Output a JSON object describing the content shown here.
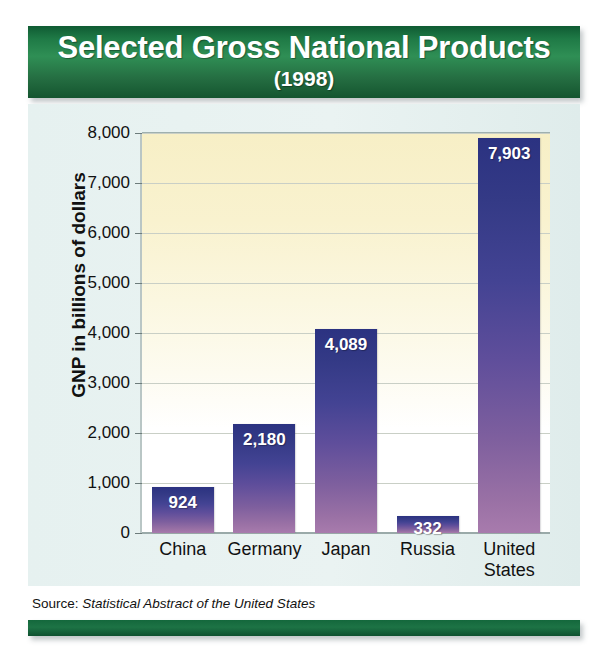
{
  "header": {
    "title": "Selected Gross National Products",
    "subtitle": "(1998)"
  },
  "source": {
    "prefix": "Source: ",
    "publication": "Statistical Abstract of the United States"
  },
  "colors": {
    "banner_green_dark": "#0f5b33",
    "banner_green_light": "#2f8f55",
    "bar_top": "#2b3281",
    "bar_bottom": "#a87bad",
    "panel_background": "#e8f2f1",
    "plot_top": "#f7efc6",
    "plot_bottom": "#ffffff",
    "gridline": "#c9cfc6",
    "text": "#111111"
  },
  "chart_data": {
    "type": "bar",
    "title": "Selected Gross National Products",
    "subtitle": "(1998)",
    "categories": [
      "China",
      "Germany",
      "Japan",
      "Russia",
      "United States"
    ],
    "category_lines": [
      [
        "China"
      ],
      [
        "Germany"
      ],
      [
        "Japan"
      ],
      [
        "Russia"
      ],
      [
        "United",
        "States"
      ]
    ],
    "values": [
      924,
      2180,
      4089,
      332,
      7903
    ],
    "value_labels": [
      "924",
      "2,180",
      "4,089",
      "332",
      "7,903"
    ],
    "xlabel": "",
    "ylabel": "GNP in billions of dollars",
    "ylim": [
      0,
      8000
    ],
    "ytick_values": [
      0,
      1000,
      2000,
      3000,
      4000,
      5000,
      6000,
      7000,
      8000
    ],
    "ytick_labels": [
      "0",
      "1,000",
      "2,000",
      "3,000",
      "4,000",
      "5,000",
      "6,000",
      "7,000",
      "8,000"
    ],
    "grid": true,
    "legend": null,
    "units": "billions of dollars",
    "year": 1998
  }
}
